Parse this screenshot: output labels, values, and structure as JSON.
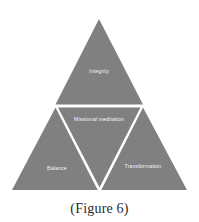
{
  "figure": {
    "caption": "(Figure 6)",
    "background_color": "#ffffff",
    "fill_color": "#808080",
    "divider_color": "#ffffff",
    "label_color": "#ffffff",
    "caption_color": "#2b2b2b"
  },
  "diagram": {
    "type": "triangle-quadrant",
    "shape": "equilateral-triangle",
    "segments": [
      {
        "id": "top",
        "position": "top",
        "label": "Integrity",
        "orientation": "point-up"
      },
      {
        "id": "center",
        "position": "center",
        "label": "Missional meditation",
        "orientation": "point-down"
      },
      {
        "id": "bottom-left",
        "position": "bottom-left",
        "label": "Balance",
        "orientation": "point-up"
      },
      {
        "id": "bottom-right",
        "position": "bottom-right",
        "label": "Transformation",
        "orientation": "point-up"
      }
    ]
  }
}
